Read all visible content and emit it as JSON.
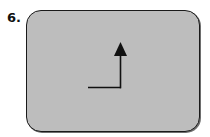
{
  "figure": {
    "number_label": "6.",
    "panel": {
      "fill_color": "#bdbdbd",
      "border_color": "#1a1a1a"
    },
    "arrow": {
      "description": "L-shaped path: horizontal line then turning up, ending in arrowhead pointing up",
      "direction": "up",
      "color": "#111111",
      "icon": "turn-up-arrow-icon"
    }
  }
}
